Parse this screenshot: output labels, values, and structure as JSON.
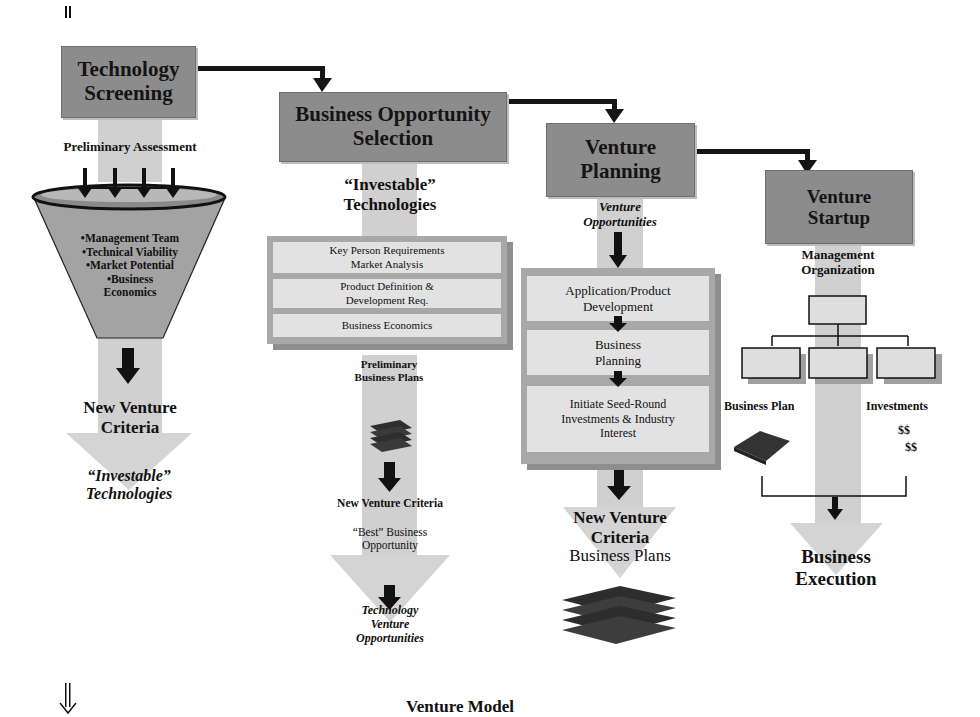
{
  "diagram": {
    "caption": "Venture Model",
    "stages": [
      {
        "title": "Technology Screening"
      },
      {
        "title": "Business Opportunity Selection"
      },
      {
        "title": "Venture Planning"
      },
      {
        "title": "Venture Startup"
      }
    ],
    "technology_screening": {
      "input_label": "Preliminary Assessment",
      "funnel_criteria": [
        "•Management Team",
        "•Technical Viability",
        "•Market Potential",
        "•Business",
        "Economics"
      ],
      "filter_label": "New Venture Criteria",
      "output_label": "“Investable” Technologies"
    },
    "business_opportunity_selection": {
      "input_label": "“Investable” Technologies",
      "activities": [
        "Key Person Requirements Market Analysis",
        "Product Definition & Development Req.",
        "Business Economics"
      ],
      "intermediate_label": "Preliminary Business Plans",
      "filter_label": "New Venture Criteria",
      "best_label": "“Best” Business Opportunity",
      "output_label": "Technology Venture Opportunities"
    },
    "venture_planning": {
      "input_label": "Venture Opportunities",
      "activities": [
        "Application/Product Development",
        "Business Planning",
        "Initiate Seed-Round Investments & Industry Interest"
      ],
      "filter_label": "New Venture Criteria",
      "output_label": "Business Plans"
    },
    "venture_startup": {
      "org_label": "Management Organization",
      "business_plan_label": "Business Plan",
      "investments_label": "Investments",
      "money_1": "$$",
      "money_2": "$$",
      "output_label": "Business Execution"
    }
  }
}
